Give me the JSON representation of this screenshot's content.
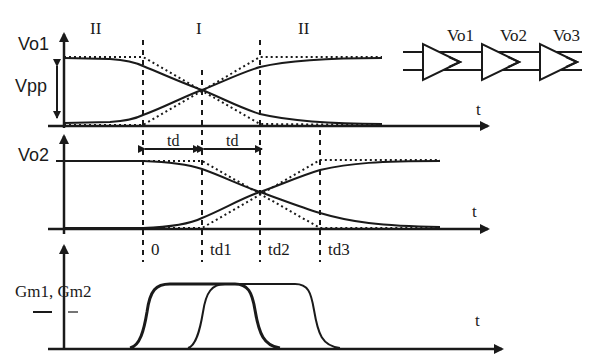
{
  "diagram": {
    "region_labels": {
      "left": "II",
      "center": "I",
      "right": "II"
    },
    "panel1": {
      "ylabel": "Vo1",
      "amplitude_label": "Vpp",
      "xlabel": "t"
    },
    "panel2": {
      "ylabel": "Vo2",
      "xlabel": "t",
      "delay_labels": [
        "td",
        "td"
      ]
    },
    "panel3": {
      "ylabel": "Gm1, Gm2",
      "xlabel": "t"
    },
    "time_markers": [
      "0",
      "td1",
      "td2",
      "td3"
    ],
    "buffer_chain": {
      "stages": [
        "Vo1",
        "Vo2",
        "Vo3"
      ]
    }
  },
  "colors": {
    "ink": "#1a1a1a",
    "background": "#ffffff"
  }
}
